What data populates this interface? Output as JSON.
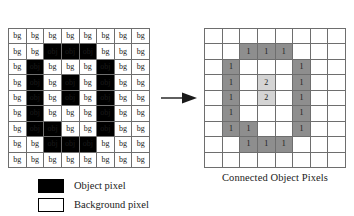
{
  "figure": {
    "arrow_icon": "right-arrow-icon"
  },
  "source_grid": {
    "name": "binary image grid",
    "columns": 8,
    "rows": 9,
    "object_color": "#000000",
    "background_color": "#ffffff",
    "grid_line_color": "#6e6e6e",
    "cells": [
      [
        "bg",
        "bg",
        "bg",
        "bg",
        "bg",
        "bg",
        "bg",
        "bg"
      ],
      [
        "bg",
        "bg",
        "obj",
        "obj",
        "obj",
        "bg",
        "bg",
        "bg"
      ],
      [
        "bg",
        "obj",
        "bg",
        "bg",
        "bg",
        "obj",
        "bg",
        "bg"
      ],
      [
        "bg",
        "obj",
        "bg",
        "obj",
        "bg",
        "obj",
        "bg",
        "bg"
      ],
      [
        "bg",
        "obj",
        "bg",
        "obj",
        "bg",
        "obj",
        "bg",
        "bg"
      ],
      [
        "bg",
        "obj",
        "bg",
        "bg",
        "bg",
        "obj",
        "bg",
        "bg"
      ],
      [
        "bg",
        "obj",
        "obj",
        "bg",
        "bg",
        "obj",
        "bg",
        "bg"
      ],
      [
        "bg",
        "bg",
        "obj",
        "obj",
        "obj",
        "bg",
        "bg",
        "bg"
      ],
      [
        "bg",
        "bg",
        "bg",
        "bg",
        "bg",
        "bg",
        "bg",
        "bg"
      ]
    ]
  },
  "labeled_grid": {
    "name": "connected object pixels grid",
    "columns": 8,
    "rows": 9,
    "label1_color": "#8e8e8e",
    "label2_color": "#d4d4d4",
    "background_color": "#ffffff",
    "grid_line_color": "#6e6e6e",
    "cells": [
      [
        {
          "v": "",
          "c": "bg"
        },
        {
          "v": "",
          "c": "bg"
        },
        {
          "v": "",
          "c": "bg"
        },
        {
          "v": "",
          "c": "bg"
        },
        {
          "v": "",
          "c": "bg"
        },
        {
          "v": "",
          "c": "bg"
        },
        {
          "v": "",
          "c": "bg"
        },
        {
          "v": "",
          "c": "bg"
        }
      ],
      [
        {
          "v": "",
          "c": "bg"
        },
        {
          "v": "",
          "c": "bg"
        },
        {
          "v": "1",
          "c": "lbl1"
        },
        {
          "v": "1",
          "c": "lbl1"
        },
        {
          "v": "1",
          "c": "lbl1"
        },
        {
          "v": "",
          "c": "bg"
        },
        {
          "v": "",
          "c": "bg"
        },
        {
          "v": "",
          "c": "bg"
        }
      ],
      [
        {
          "v": "",
          "c": "bg"
        },
        {
          "v": "1",
          "c": "lbl1"
        },
        {
          "v": "",
          "c": "bg"
        },
        {
          "v": "",
          "c": "bg"
        },
        {
          "v": "",
          "c": "bg"
        },
        {
          "v": "1",
          "c": "lbl1"
        },
        {
          "v": "",
          "c": "bg"
        },
        {
          "v": "",
          "c": "bg"
        }
      ],
      [
        {
          "v": "",
          "c": "bg"
        },
        {
          "v": "1",
          "c": "lbl1"
        },
        {
          "v": "",
          "c": "bg"
        },
        {
          "v": "2",
          "c": "lbl2"
        },
        {
          "v": "",
          "c": "bg"
        },
        {
          "v": "1",
          "c": "lbl1"
        },
        {
          "v": "",
          "c": "bg"
        },
        {
          "v": "",
          "c": "bg"
        }
      ],
      [
        {
          "v": "",
          "c": "bg"
        },
        {
          "v": "1",
          "c": "lbl1"
        },
        {
          "v": "",
          "c": "bg"
        },
        {
          "v": "2",
          "c": "lbl2"
        },
        {
          "v": "",
          "c": "bg"
        },
        {
          "v": "1",
          "c": "lbl1"
        },
        {
          "v": "",
          "c": "bg"
        },
        {
          "v": "",
          "c": "bg"
        }
      ],
      [
        {
          "v": "",
          "c": "bg"
        },
        {
          "v": "1",
          "c": "lbl1"
        },
        {
          "v": "",
          "c": "bg"
        },
        {
          "v": "",
          "c": "bg"
        },
        {
          "v": "",
          "c": "bg"
        },
        {
          "v": "1",
          "c": "lbl1"
        },
        {
          "v": "",
          "c": "bg"
        },
        {
          "v": "",
          "c": "bg"
        }
      ],
      [
        {
          "v": "",
          "c": "bg"
        },
        {
          "v": "1",
          "c": "lbl1"
        },
        {
          "v": "1",
          "c": "lbl1"
        },
        {
          "v": "",
          "c": "bg"
        },
        {
          "v": "",
          "c": "bg"
        },
        {
          "v": "1",
          "c": "lbl1"
        },
        {
          "v": "",
          "c": "bg"
        },
        {
          "v": "",
          "c": "bg"
        }
      ],
      [
        {
          "v": "",
          "c": "bg"
        },
        {
          "v": "",
          "c": "bg"
        },
        {
          "v": "1",
          "c": "lbl1"
        },
        {
          "v": "1",
          "c": "lbl1"
        },
        {
          "v": "1",
          "c": "lbl1"
        },
        {
          "v": "",
          "c": "bg"
        },
        {
          "v": "",
          "c": "bg"
        },
        {
          "v": "",
          "c": "bg"
        }
      ],
      [
        {
          "v": "",
          "c": "bg"
        },
        {
          "v": "",
          "c": "bg"
        },
        {
          "v": "",
          "c": "bg"
        },
        {
          "v": "",
          "c": "bg"
        },
        {
          "v": "",
          "c": "bg"
        },
        {
          "v": "",
          "c": "bg"
        },
        {
          "v": "",
          "c": "bg"
        },
        {
          "v": "",
          "c": "bg"
        }
      ]
    ]
  },
  "right_caption": "Connected Object Pixels",
  "legend": {
    "items": [
      {
        "swatch": "filled",
        "label": "Object pixel"
      },
      {
        "swatch": "hollow",
        "label": "Background pixel"
      }
    ]
  }
}
